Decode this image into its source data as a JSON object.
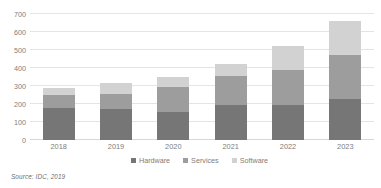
{
  "chart_data": {
    "type": "bar",
    "subtype": "stacked-column",
    "title": "",
    "xlabel": "",
    "ylabel": "",
    "ylim": [
      0,
      700
    ],
    "ytick_step": 100,
    "yticks": [
      0,
      100,
      200,
      300,
      400,
      500,
      600,
      700
    ],
    "grid": true,
    "legend_position": "bottom",
    "categories": [
      "2018",
      "2019",
      "2020",
      "2021",
      "2022",
      "2023"
    ],
    "series": [
      {
        "name": "Hardware",
        "color": "#767676",
        "values": [
          180,
          170,
          155,
          195,
          195,
          230
        ]
      },
      {
        "name": "Services",
        "color": "#9d9d9d",
        "values": [
          70,
          85,
          140,
          160,
          195,
          245
        ]
      },
      {
        "name": "Software",
        "color": "#d2d2d2",
        "values": [
          40,
          60,
          55,
          65,
          130,
          185
        ]
      }
    ],
    "totals": [
      290,
      315,
      350,
      420,
      520,
      660
    ],
    "source_note": "Source: IDC, 2019"
  },
  "axis": {
    "y_labels": [
      "700",
      "600",
      "500",
      "400",
      "300",
      "200",
      "100",
      "0"
    ],
    "x_labels": [
      "2018",
      "2019",
      "2020",
      "2021",
      "2022",
      "2023"
    ]
  },
  "legend": {
    "items": [
      {
        "label": "Hardware",
        "color": "#767676"
      },
      {
        "label": "Services",
        "color": "#9d9d9d"
      },
      {
        "label": "Software",
        "color": "#d2d2d2"
      }
    ]
  },
  "footer": {
    "source": "Source: IDC, 2019"
  }
}
